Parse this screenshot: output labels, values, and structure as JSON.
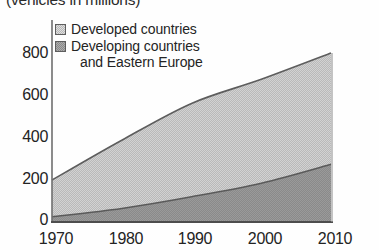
{
  "chart_data": {
    "type": "area",
    "title": "(vehicles in millions)",
    "xlabel": "",
    "ylabel": "",
    "stacked": true,
    "grid": false,
    "legend_position": "top-left",
    "x": [
      1970,
      1980,
      1990,
      2000,
      2010
    ],
    "categories": [
      "1970",
      "1980",
      "1990",
      "2000",
      "2010"
    ],
    "xlim": [
      1970,
      2010
    ],
    "ylim": [
      0,
      800
    ],
    "yticks": [
      0,
      200,
      400,
      600,
      800
    ],
    "ytick_labels": [
      "0",
      "200",
      "400",
      "600",
      "800"
    ],
    "xtick_labels": [
      "1970",
      "1980",
      "1990",
      "2000",
      "2010"
    ],
    "series": [
      {
        "name": "Developing countries and Eastern Europe",
        "values": [
          20,
          60,
          115,
          180,
          270
        ],
        "color": "#8a8a8a",
        "stack_order": 0
      },
      {
        "name": "Developed countries",
        "values": [
          175,
          325,
          445,
          495,
          530
        ],
        "color": "#b7b7b7",
        "stack_order": 1
      }
    ],
    "totals": [
      195,
      385,
      560,
      675,
      800
    ]
  },
  "legend": {
    "items": [
      {
        "label": "Developed countries",
        "label_line2": "",
        "swatch": "light-gray-swatch",
        "color": "#b7b7b7"
      },
      {
        "label": "Developing countries",
        "label_line2": "and Eastern Europe",
        "swatch": "dark-gray-swatch",
        "color": "#8a8a8a"
      }
    ]
  },
  "axes": {
    "y_ticks": [
      {
        "label": "800",
        "value": 800,
        "y": 53
      },
      {
        "label": "600",
        "value": 600,
        "y": 95
      },
      {
        "label": "400",
        "value": 400,
        "y": 137
      },
      {
        "label": "200",
        "value": 200,
        "y": 179
      },
      {
        "label": "0",
        "value": 0,
        "y": 221
      }
    ],
    "x_ticks": [
      {
        "label": "1970",
        "value": 1970,
        "x": 52
      },
      {
        "label": "1980",
        "value": 1980,
        "x": 122
      },
      {
        "label": "1990",
        "value": 1990,
        "x": 191
      },
      {
        "label": "2000",
        "value": 2000,
        "x": 261
      },
      {
        "label": "2010",
        "value": 2010,
        "x": 331
      }
    ]
  },
  "colors": {
    "developed": "#b7b7b7",
    "developing": "#8a8a8a",
    "axis": "#6f6f6f",
    "text": "#232323",
    "background": "#ffffff"
  }
}
